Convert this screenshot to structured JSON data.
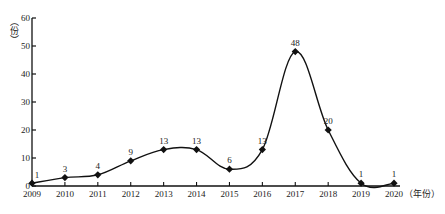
{
  "chart_data": {
    "type": "line",
    "title": "",
    "xlabel": "（年份）",
    "ylabel": "（份）",
    "x": [
      "2009",
      "2010",
      "2011",
      "2012",
      "2013",
      "2014",
      "2015",
      "2016",
      "2017",
      "2018",
      "2019",
      "2020"
    ],
    "series": [
      {
        "name": "count",
        "values": [
          1,
          3,
          4,
          9,
          13,
          13,
          6,
          13,
          48,
          20,
          1,
          1
        ]
      }
    ],
    "ylim": [
      0,
      60
    ],
    "yticks": [
      0,
      10,
      20,
      30,
      40,
      50,
      60
    ],
    "grid": false,
    "legend": null,
    "marker": "diamond",
    "smooth": true,
    "line_color": "#111111"
  }
}
